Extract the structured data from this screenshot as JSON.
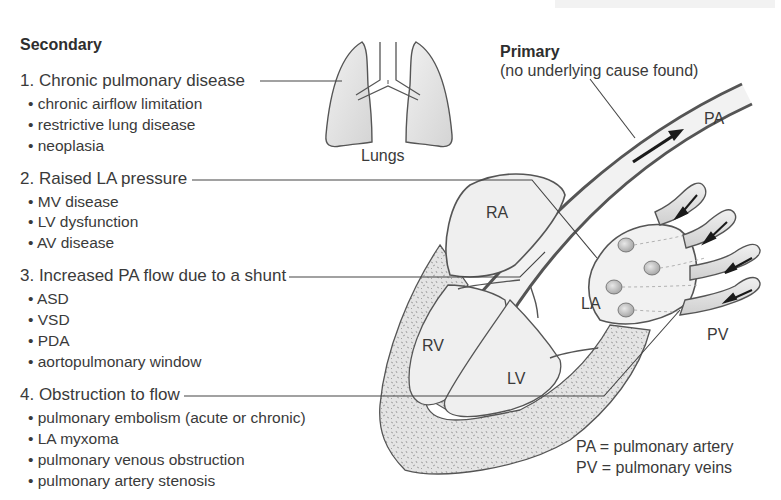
{
  "figure": {
    "title_partial": "",
    "secondary": {
      "heading": "Secondary",
      "groups": [
        {
          "title": "1. Chronic pulmonary disease",
          "items": [
            "• chronic airflow limitation",
            "• restrictive lung disease",
            "• neoplasia"
          ]
        },
        {
          "title": "2. Raised LA pressure",
          "items": [
            "• MV disease",
            "• LV dysfunction",
            "• AV disease"
          ]
        },
        {
          "title": "3. Increased PA flow due to a shunt",
          "items": [
            "• ASD",
            "• VSD",
            "• PDA",
            "• aortopulmonary window"
          ]
        },
        {
          "title": "4. Obstruction to flow",
          "items": [
            "• pulmonary embolism (acute or chronic)",
            "• LA myxoma",
            "• pulmonary venous obstruction",
            "• pulmonary artery stenosis"
          ]
        }
      ]
    },
    "primary": {
      "heading": "Primary",
      "subtitle": "(no underlying cause found)"
    },
    "anatomy_labels": {
      "lungs": "Lungs",
      "pa": "PA",
      "ra": "RA",
      "la": "LA",
      "rv": "RV",
      "lv": "LV",
      "pv": "PV"
    },
    "legend": [
      "PA = pulmonary artery",
      "PV = pulmonary veins"
    ],
    "colors": {
      "text": "#3a3a3a",
      "outline": "#555555",
      "fill_light": "#ececec",
      "fill_mid": "#d6d6d6",
      "muscle": "#e2e2e2"
    }
  }
}
